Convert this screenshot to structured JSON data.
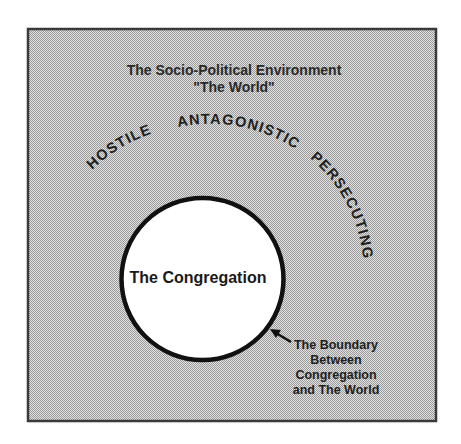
{
  "diagram": {
    "title_line1": "The Socio-Political Environment",
    "title_line2": "\"The World\"",
    "environment_attributes": [
      {
        "label": "HOSTILE"
      },
      {
        "label": "ANTAGONISTIC"
      },
      {
        "label": "PERSECUTING"
      }
    ],
    "inner_circle_label": "The Congregation",
    "boundary_label": {
      "line1": "The Boundary",
      "line2": "Between",
      "line3": "Congregation",
      "line4": "and The World"
    },
    "colors": {
      "frame_border": "#3a3a3a",
      "stipple_dark": "#9a9a9a",
      "stipple_light": "#e2e2e2",
      "circle_fill": "#ffffff",
      "circle_stroke": "#111111",
      "text": "#1e1e1e"
    }
  }
}
